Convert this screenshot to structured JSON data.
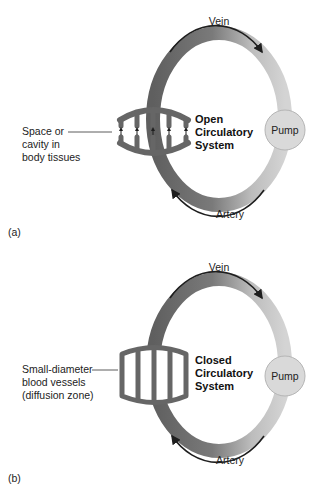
{
  "panels": [
    {
      "id": "a",
      "panel_label": "(a)",
      "system_title": [
        "Open",
        "Circulatory",
        "System"
      ],
      "vein_label": "Vein",
      "artery_label": "Artery",
      "pump_label": "Pump",
      "side_label": [
        "Space or",
        "cavity in",
        "body tissues"
      ],
      "bed_type": "open"
    },
    {
      "id": "b",
      "panel_label": "(b)",
      "system_title": [
        "Closed",
        "Circulatory",
        "System"
      ],
      "vein_label": "Vein",
      "artery_label": "Artery",
      "pump_label": "Pump",
      "side_label": [
        "Small-diameter",
        "blood vessels",
        "(diffusion zone)"
      ],
      "bed_type": "closed"
    }
  ],
  "colors": {
    "vessel_dark": "#6a6a6a",
    "vessel_light": "#cfcfcf",
    "pump_fill": "#d9d9d9",
    "arrow": "#1e1e1e"
  }
}
